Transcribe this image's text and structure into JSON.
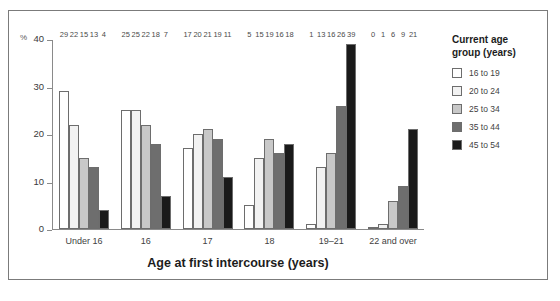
{
  "chart_data": {
    "type": "bar",
    "title": "",
    "xlabel": "Age at first intercourse (years)",
    "ylabel": "%",
    "ylim": [
      0,
      40
    ],
    "yticks": [
      0,
      10,
      20,
      30,
      40
    ],
    "grid": false,
    "legend_position": "right",
    "legend_title": "Current age\ngroup (years)",
    "categories": [
      "Under 16",
      "16",
      "17",
      "18",
      "19–21",
      "22 and over"
    ],
    "series": [
      {
        "name": "16 to 19",
        "color": "#ffffff",
        "values": [
          29,
          25,
          17,
          5,
          1,
          0
        ]
      },
      {
        "name": "20 to 24",
        "color": "#f2f2f2",
        "values": [
          22,
          25,
          20,
          15,
          13,
          1
        ]
      },
      {
        "name": "25 to 34",
        "color": "#c8c8c8",
        "values": [
          15,
          22,
          21,
          19,
          16,
          6
        ]
      },
      {
        "name": "35 to 44",
        "color": "#6e6e6e",
        "values": [
          13,
          18,
          19,
          16,
          26,
          9
        ]
      },
      {
        "name": "45 to 54",
        "color": "#1a1a1a",
        "values": [
          4,
          7,
          11,
          18,
          39,
          21
        ]
      }
    ]
  }
}
